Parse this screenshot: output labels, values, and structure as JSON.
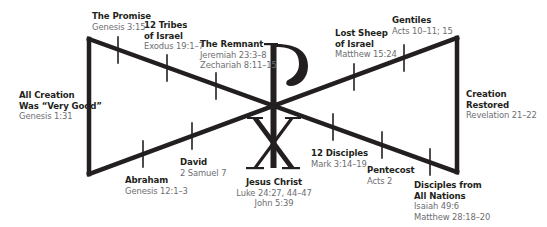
{
  "diagram": {
    "colors": {
      "line": "#231f20",
      "title_text": "#231f20",
      "ref_text": "#6d6e71",
      "background": "#ffffff"
    },
    "center_symbol": {
      "name": "Chi-Rho",
      "upper_glyph": "P",
      "lower_glyph": "X"
    },
    "endpoints": {
      "left": {
        "title": [
          "All Creation",
          "Was “Very Good”"
        ],
        "refs": [
          "Genesis 1:31"
        ]
      },
      "right": {
        "title": [
          "Creation",
          "Restored"
        ],
        "refs": [
          "Revelation 21–22"
        ]
      }
    },
    "events": [
      {
        "id": "promise",
        "title": [
          "The Promise"
        ],
        "refs": [
          "Genesis 3:15"
        ]
      },
      {
        "id": "tribes",
        "title": [
          "12 Tribes",
          "of Israel"
        ],
        "refs": [
          "Exodus 19:1–7"
        ]
      },
      {
        "id": "remnant",
        "title": [
          "The Remnant"
        ],
        "refs": [
          "Jeremiah 23:3–8",
          "Zechariah 8:11–15"
        ]
      },
      {
        "id": "abraham",
        "title": [
          "Abraham"
        ],
        "refs": [
          "Genesis 12:1–3"
        ]
      },
      {
        "id": "david",
        "title": [
          "David"
        ],
        "refs": [
          "2 Samuel 7"
        ]
      },
      {
        "id": "jesus",
        "title": [
          "Jesus Christ"
        ],
        "refs": [
          "Luke 24:27, 44–47",
          "John 5:39"
        ]
      },
      {
        "id": "disciples",
        "title": [
          "12 Disciples"
        ],
        "refs": [
          "Mark 3:14–19"
        ]
      },
      {
        "id": "pentecost",
        "title": [
          "Pentecost"
        ],
        "refs": [
          "Acts 2"
        ]
      },
      {
        "id": "nations",
        "title": [
          "Disciples from",
          "All Nations"
        ],
        "refs": [
          "Isaiah 49:6",
          "Matthew 28:18–20"
        ]
      },
      {
        "id": "lostsheep",
        "title": [
          "Lost Sheep",
          "of Israel"
        ],
        "refs": [
          "Matthew 15:24"
        ]
      },
      {
        "id": "gentiles",
        "title": [
          "Gentiles"
        ],
        "refs": [
          "Acts 10–11; 15"
        ]
      }
    ]
  }
}
